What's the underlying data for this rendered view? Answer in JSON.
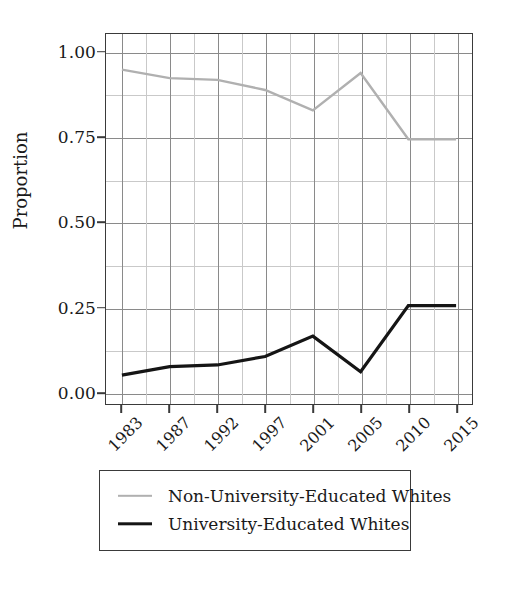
{
  "chart_data": {
    "type": "line",
    "title": "",
    "xlabel": "",
    "ylabel": "Proportion",
    "categories": [
      "1983",
      "1987",
      "1992",
      "1997",
      "2001",
      "2005",
      "2010",
      "2015"
    ],
    "x_tick_labels": [
      "1983",
      "1987",
      "1992",
      "1997",
      "2001",
      "2005",
      "2010",
      "2015"
    ],
    "y_tick_labels": [
      "0.00",
      "0.25",
      "0.50",
      "0.75",
      "1.00"
    ],
    "y_tick_values": [
      0.0,
      0.25,
      0.5,
      0.75,
      1.0
    ],
    "ylim": [
      -0.035,
      1.055
    ],
    "grid": true,
    "minor_grid": true,
    "legend_position": "below-plot",
    "series": [
      {
        "name": "Non-University-Educated Whites",
        "color": "#b0b0b0",
        "line_width": 2.4,
        "values": [
          0.95,
          0.925,
          0.92,
          0.89,
          0.83,
          0.94,
          0.745,
          0.745
        ]
      },
      {
        "name": "University-Educated Whites",
        "color": "#151515",
        "line_width": 3.2,
        "values": [
          0.05,
          0.075,
          0.08,
          0.105,
          0.165,
          0.06,
          0.255,
          0.255
        ]
      }
    ]
  },
  "axis": {
    "y_title": "Proportion"
  },
  "legend": {
    "entries": [
      {
        "label": "Non-University-Educated Whites",
        "color": "#b0b0b0",
        "width": "2.4px"
      },
      {
        "label": "University-Educated Whites",
        "color": "#151515",
        "width": "3.4px"
      }
    ]
  },
  "colors": {
    "frame": "#3a3a3a",
    "grid_major": "#8a8a8a",
    "grid_minor": "#c9c9c9",
    "text": "#1a1a1a",
    "background": "#ffffff"
  }
}
